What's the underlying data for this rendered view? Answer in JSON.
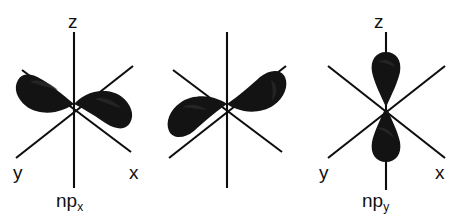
{
  "figure": {
    "background_color": "#ffffff",
    "line_color": "#0d0d0d",
    "lobe_color": "#131313",
    "width": 459,
    "height": 224
  },
  "panels": [
    {
      "id": "px",
      "orbital_label_base": "np",
      "orbital_label_sub": "x",
      "axes": [
        {
          "name": "z",
          "label": "z"
        },
        {
          "name": "y",
          "label": "y"
        },
        {
          "name": "x",
          "label": "x"
        }
      ],
      "lobe_axis": "x",
      "lobe_count": 2,
      "lobe_orientation_deg": -20
    },
    {
      "id": "py",
      "orbital_label_base": "np",
      "orbital_label_sub": "y",
      "axes": [
        {
          "name": "z",
          "label": "z"
        },
        {
          "name": "y",
          "label": "y"
        },
        {
          "name": "x",
          "label": "x"
        }
      ],
      "lobe_axis": "y",
      "lobe_count": 2,
      "lobe_orientation_deg": -35
    },
    {
      "id": "pz",
      "orbital_label_base": "np",
      "orbital_label_sub": "z",
      "axes": [
        {
          "name": "z",
          "label": "z"
        },
        {
          "name": "y",
          "label": "y"
        },
        {
          "name": "x",
          "label": "x"
        }
      ],
      "lobe_axis": "z",
      "lobe_count": 2,
      "lobe_orientation_deg": 90
    }
  ],
  "labels": {
    "px": {
      "z": "z",
      "y": "y",
      "x": "x",
      "name_base": "np",
      "name_sub": "x"
    },
    "py": {
      "z": "z",
      "y": "y",
      "x": "x",
      "name_base": "np",
      "name_sub": "y"
    },
    "pz": {
      "z": "z",
      "y": "y",
      "x": "x",
      "name_base": "np",
      "name_sub": "z"
    }
  }
}
